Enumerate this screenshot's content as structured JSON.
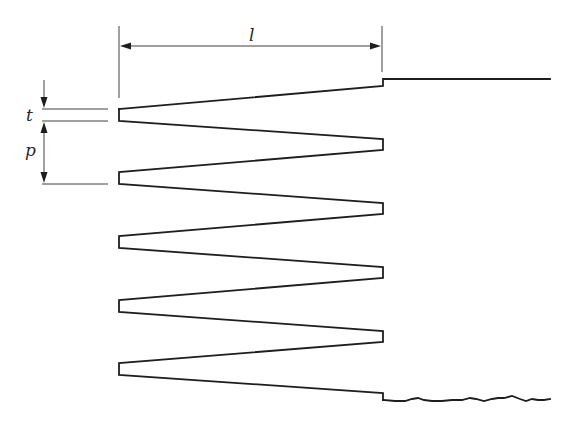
{
  "diagram": {
    "colors": {
      "line": "#1e1e1e",
      "background": "#ffffff"
    },
    "labels": {
      "length": "l",
      "thickness": "t",
      "pitch": "p"
    },
    "geometry": {
      "left_tip_x": 119,
      "right_tip_x": 383,
      "left_tips": [
        {
          "top": 109,
          "bottom": 121
        },
        {
          "top": 172,
          "bottom": 184
        },
        {
          "top": 236,
          "bottom": 248
        },
        {
          "top": 300,
          "bottom": 312
        },
        {
          "top": 363,
          "bottom": 375
        }
      ],
      "right_tips": [
        {
          "top": 139,
          "bottom": 150
        },
        {
          "top": 203,
          "bottom": 214
        },
        {
          "top": 267,
          "bottom": 278
        },
        {
          "top": 331,
          "bottom": 342
        }
      ],
      "top_edge": {
        "start_y": 86,
        "step_y": 79,
        "end_x": 550
      },
      "bottom_edge": {
        "start_y": 393,
        "step_y": 400,
        "end_x": 550,
        "style": "broken-wavy"
      }
    }
  }
}
